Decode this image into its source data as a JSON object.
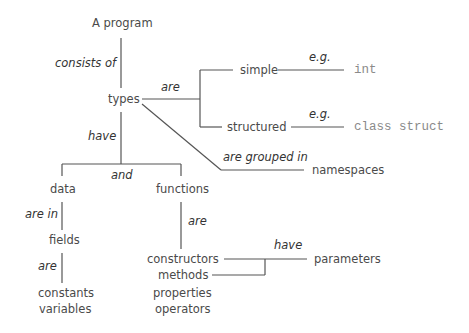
{
  "diagram": {
    "type": "concept-tree",
    "line_color": "#555555",
    "nodes": {
      "root": "A program",
      "types": "types",
      "simple": "simple",
      "structured": "structured",
      "int": "int",
      "class_struct": "class struct",
      "namespaces": "namespaces",
      "data": "data",
      "functions": "functions",
      "fields": "fields",
      "constants": "constants",
      "variables": "variables",
      "constructors": "constructors",
      "methods": "methods",
      "properties": "properties",
      "operators": "operators",
      "parameters": "parameters"
    },
    "relations": {
      "consists_of": "consists of",
      "are_types": "are",
      "eg_simple": "e.g.",
      "eg_structured": "e.g.",
      "are_grouped_in": "are grouped in",
      "have": "have",
      "and": "and",
      "are_in": "are in",
      "are_fields": "are",
      "are_functions": "are",
      "have_params": "have"
    }
  }
}
